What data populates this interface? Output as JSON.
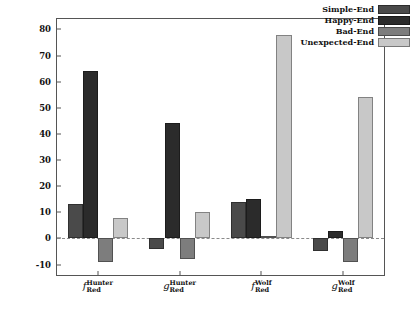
{
  "chart_data": {
    "type": "bar",
    "title": "",
    "xlabel": "",
    "ylabel": "",
    "ylim": [
      -14,
      84
    ],
    "yticks": [
      -10,
      0,
      10,
      20,
      30,
      40,
      50,
      60,
      70,
      80
    ],
    "ytick_labels": [
      "-10",
      "0",
      "10",
      "20",
      "30",
      "40",
      "50",
      "60",
      "70",
      "80"
    ],
    "grid": false,
    "zero_line": 0,
    "legend_position": "top-right",
    "categories": [
      {
        "base": "f",
        "sup": "Hunter",
        "sub": "Red"
      },
      {
        "base": "g",
        "sup": "Hunter",
        "sub": "Red"
      },
      {
        "base": "f",
        "sup": "Wolf",
        "sub": "Red"
      },
      {
        "base": "g",
        "sup": "Wolf",
        "sub": "Red"
      }
    ],
    "series": [
      {
        "name": "Simple-End",
        "color": "#4a4a4a",
        "values": [
          13,
          -4,
          14,
          -5
        ]
      },
      {
        "name": "Happy-End",
        "color": "#2b2b2b",
        "values": [
          64,
          44,
          15,
          3
        ]
      },
      {
        "name": "Bad-End",
        "color": "#7d7d7d",
        "values": [
          -9,
          -8,
          1,
          -9
        ]
      },
      {
        "name": "Unexpected-End",
        "color": "#c8c8c8",
        "values": [
          8,
          10,
          78,
          54
        ]
      }
    ]
  }
}
